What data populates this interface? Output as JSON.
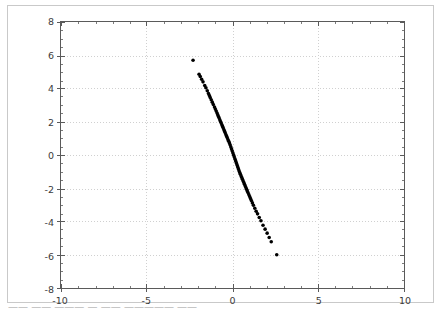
{
  "figure": {
    "background_color": "#ffffff",
    "frame_color": "#c9c9c9",
    "axis_color": "#5a5a5a",
    "grid_color": "#d0d0d0",
    "marker_color": "#000000",
    "tick_label_color": "#3b3b3b"
  },
  "bottom_strip": {
    "text": "——  —— ——— — —— ————— ——"
  },
  "chart_data": {
    "type": "scatter",
    "title": "",
    "subtitle": "",
    "xlabel": "",
    "ylabel": "",
    "xlim": [
      -10,
      10
    ],
    "ylim": [
      -8,
      8
    ],
    "xticks": [
      -10,
      -5,
      0,
      5,
      10
    ],
    "yticks": [
      8,
      6,
      4,
      2,
      0,
      -2,
      -4,
      -6,
      -8
    ],
    "xtick_labels": [
      "-10",
      "-5",
      "0",
      "5",
      "10"
    ],
    "ytick_labels": [
      "8",
      "6",
      "4",
      "2",
      "0",
      "-2",
      "-4",
      "-6",
      "-8"
    ],
    "x_minor_tick_step": 1,
    "y_minor_tick_step": 0.5,
    "grid": true,
    "grid_style": "dotted",
    "grid_axis": "both",
    "legend": null,
    "legend_position": null,
    "marker": "circle",
    "marker_size": 3.6,
    "series": [
      {
        "name": "points",
        "color": "#000000",
        "x": [
          -2.3,
          -1.95,
          -1.88,
          -1.8,
          -1.72,
          -1.62,
          -1.55,
          -1.47,
          -1.4,
          -1.35,
          -1.3,
          -1.24,
          -1.18,
          -1.12,
          -1.05,
          -1.0,
          -0.95,
          -0.9,
          -0.86,
          -0.82,
          -0.78,
          -0.74,
          -0.7,
          -0.66,
          -0.62,
          -0.58,
          -0.54,
          -0.5,
          -0.46,
          -0.42,
          -0.38,
          -0.34,
          -0.3,
          -0.26,
          -0.22,
          -0.18,
          -0.14,
          -0.1,
          -0.06,
          -0.02,
          0.02,
          0.06,
          0.1,
          0.14,
          0.18,
          0.22,
          0.26,
          0.3,
          0.34,
          0.38,
          0.42,
          0.46,
          0.5,
          0.54,
          0.58,
          0.62,
          0.66,
          0.7,
          0.74,
          0.78,
          0.82,
          0.86,
          0.9,
          0.95,
          1.0,
          1.05,
          1.1,
          1.16,
          1.22,
          1.3,
          1.38,
          1.46,
          1.56,
          1.66,
          1.78,
          1.9,
          2.02,
          2.14,
          2.26,
          2.58
        ],
        "y": [
          5.7,
          4.86,
          4.72,
          4.56,
          4.4,
          4.18,
          4.04,
          3.86,
          3.7,
          3.58,
          3.46,
          3.32,
          3.18,
          3.04,
          2.88,
          2.76,
          2.64,
          2.52,
          2.42,
          2.32,
          2.22,
          2.12,
          2.02,
          1.92,
          1.82,
          1.72,
          1.62,
          1.52,
          1.42,
          1.32,
          1.22,
          1.12,
          1.02,
          0.92,
          0.82,
          0.72,
          0.62,
          0.5,
          0.38,
          0.26,
          0.14,
          0.02,
          -0.1,
          -0.22,
          -0.34,
          -0.46,
          -0.58,
          -0.7,
          -0.82,
          -0.94,
          -1.06,
          -1.16,
          -1.26,
          -1.36,
          -1.46,
          -1.56,
          -1.66,
          -1.76,
          -1.86,
          -1.96,
          -2.06,
          -2.16,
          -2.26,
          -2.38,
          -2.5,
          -2.62,
          -2.74,
          -2.88,
          -3.02,
          -3.2,
          -3.38,
          -3.54,
          -3.76,
          -3.96,
          -4.22,
          -4.46,
          -4.7,
          -4.96,
          -5.22,
          -6.0
        ]
      }
    ]
  }
}
